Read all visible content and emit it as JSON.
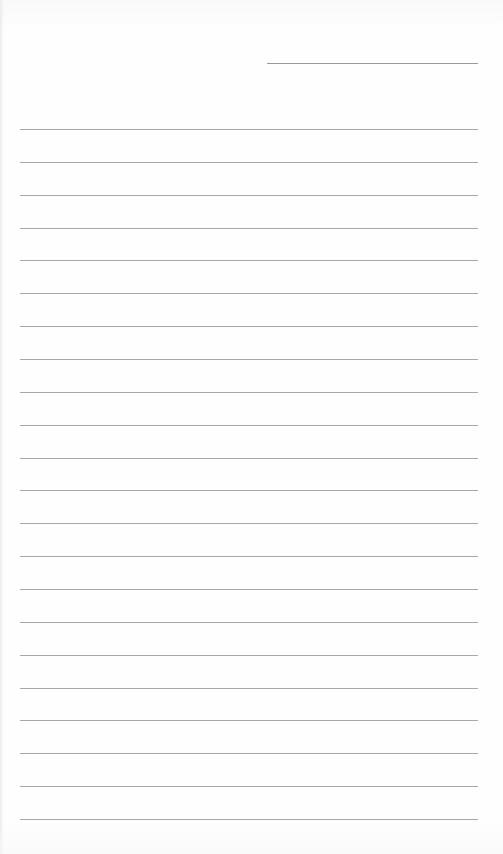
{
  "document": {
    "type": "lined-paper",
    "header_line": {
      "label": ""
    },
    "ruled_lines": [
      {
        "text": ""
      },
      {
        "text": ""
      },
      {
        "text": ""
      },
      {
        "text": ""
      },
      {
        "text": ""
      },
      {
        "text": ""
      },
      {
        "text": ""
      },
      {
        "text": ""
      },
      {
        "text": ""
      },
      {
        "text": ""
      },
      {
        "text": ""
      },
      {
        "text": ""
      },
      {
        "text": ""
      },
      {
        "text": ""
      },
      {
        "text": ""
      },
      {
        "text": ""
      },
      {
        "text": ""
      },
      {
        "text": ""
      },
      {
        "text": ""
      },
      {
        "text": ""
      },
      {
        "text": ""
      },
      {
        "text": ""
      }
    ],
    "line_color": "#a8a8a8",
    "paper_color": "#fefefe"
  }
}
